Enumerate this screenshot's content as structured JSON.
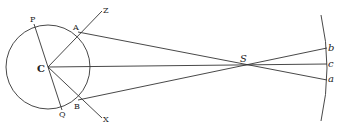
{
  "diagram": {
    "type": "geometric-optics-figure",
    "points": {
      "P": {
        "label": "P"
      },
      "A": {
        "label": "A"
      },
      "Z": {
        "label": "Z"
      },
      "C": {
        "label": "C"
      },
      "B": {
        "label": "B"
      },
      "Q": {
        "label": "Q"
      },
      "X": {
        "label": "X"
      },
      "S": {
        "label": "S"
      },
      "b": {
        "label": "b"
      },
      "c": {
        "label": "c"
      },
      "a": {
        "label": "a"
      }
    },
    "elements": [
      "circle centered at C",
      "diameter PQ through C",
      "line CZ through A",
      "line CX through B",
      "lines A-S-a, C-S-c, B-S-b crossing at S",
      "arc screen on the right containing b, c, a"
    ]
  }
}
